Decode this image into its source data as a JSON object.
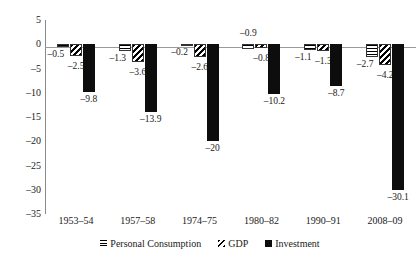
{
  "chart_data": {
    "type": "bar",
    "title": "",
    "subtitle": "",
    "xlabel": "",
    "ylabel": "",
    "ylim": [
      -35,
      5
    ],
    "ytick_step": 5,
    "grid": false,
    "legend_position": "bottom",
    "orientation": "vertical",
    "grouping": "clustered",
    "categories": [
      "1953–54",
      "1957–58",
      "1974–75",
      "1980–82",
      "1990–91",
      "2008–09"
    ],
    "ytick_labels": [
      "5",
      "0",
      "–5",
      "–10",
      "–15",
      "–20",
      "–25",
      "–30",
      "–35"
    ],
    "ytick_values": [
      5,
      0,
      -5,
      -10,
      -15,
      -20,
      -25,
      -30,
      -35
    ],
    "series": [
      {
        "name": "Personal Consumption",
        "pattern": "horizontal-stripes",
        "color": "#000000",
        "values": [
          -0.5,
          -1.3,
          -0.2,
          -0.9,
          -1.1,
          -2.7
        ],
        "labels": [
          "–0.5",
          "–1.3",
          "–0.2",
          "–0.9",
          "–1.1",
          "–2.7"
        ]
      },
      {
        "name": "GDP",
        "pattern": "diagonal-stripes",
        "color": "#000000",
        "values": [
          -2.5,
          -3.6,
          -2.6,
          -0.8,
          -1.3,
          -4.2
        ],
        "labels": [
          "–2.5",
          "–3.6",
          "–2.6",
          "–0.8",
          "–1.3",
          "–4.2"
        ]
      },
      {
        "name": "Investment",
        "pattern": "solid",
        "color": "#0d0d0d",
        "values": [
          -9.8,
          -13.9,
          -20,
          -10.2,
          -8.7,
          -30.1
        ],
        "labels": [
          "–9.8",
          "–13.9",
          "–20",
          "–10.2",
          "–8.7",
          "–30.1"
        ]
      }
    ]
  },
  "legend": {
    "items": [
      {
        "label": "Personal Consumption",
        "swatch": "horizontal-stripes-swatch"
      },
      {
        "label": "GDP",
        "swatch": "diagonal-stripes-swatch"
      },
      {
        "label": "Investment",
        "swatch": "solid-black-swatch"
      }
    ]
  }
}
